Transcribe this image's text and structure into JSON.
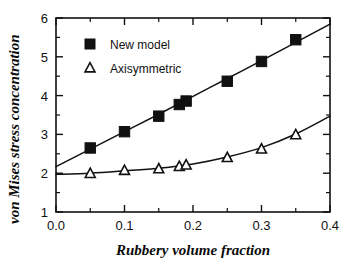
{
  "chart_data": {
    "type": "scatter",
    "title": "",
    "xlabel": "Rubbery  volume  fraction",
    "ylabel": "von  Mises  stress  concentration",
    "xlim": [
      0.0,
      0.4
    ],
    "ylim": [
      1,
      6
    ],
    "xticks": [
      0.0,
      0.1,
      0.2,
      0.3,
      0.4
    ],
    "xtick_labels": [
      "0.0",
      "0.1",
      "0.2",
      "0.3",
      "0.4"
    ],
    "yticks": [
      1,
      2,
      3,
      4,
      5,
      6
    ],
    "ytick_labels": [
      "1",
      "2",
      "3",
      "4",
      "5",
      "6"
    ],
    "x_minor_ticks": [
      0.05,
      0.15,
      0.25,
      0.35
    ],
    "y_minor_ticks": [
      1.5,
      2.5,
      3.5,
      4.5,
      5.5
    ],
    "grid": false,
    "legend_position": "upper left",
    "series": [
      {
        "name": "New model",
        "marker": "filled-square",
        "x": [
          0.05,
          0.1,
          0.15,
          0.18,
          0.19,
          0.25,
          0.3,
          0.35
        ],
        "values": [
          2.65,
          3.07,
          3.47,
          3.77,
          3.86,
          4.37,
          4.88,
          5.44
        ],
        "fit_x": [
          0.0,
          0.05,
          0.1,
          0.15,
          0.2,
          0.25,
          0.3,
          0.35,
          0.4
        ],
        "fit_y": [
          2.17,
          2.62,
          3.07,
          3.52,
          3.98,
          4.44,
          4.9,
          5.37,
          5.84
        ]
      },
      {
        "name": "Axisymmetric",
        "marker": "open-triangle",
        "x": [
          0.05,
          0.1,
          0.15,
          0.18,
          0.19,
          0.25,
          0.3,
          0.35
        ],
        "values": [
          1.99,
          2.07,
          2.11,
          2.17,
          2.21,
          2.4,
          2.62,
          2.99
        ],
        "fit_x": [
          0.0,
          0.05,
          0.1,
          0.15,
          0.2,
          0.25,
          0.3,
          0.35,
          0.4
        ],
        "fit_y": [
          1.97,
          2.0,
          2.06,
          2.13,
          2.24,
          2.42,
          2.66,
          3.01,
          3.47
        ]
      }
    ]
  },
  "legend": {
    "entries": [
      {
        "label": "New model"
      },
      {
        "label": "Axisymmetric"
      }
    ]
  },
  "colors": {
    "ink": "#111111",
    "background": "#ffffff"
  }
}
